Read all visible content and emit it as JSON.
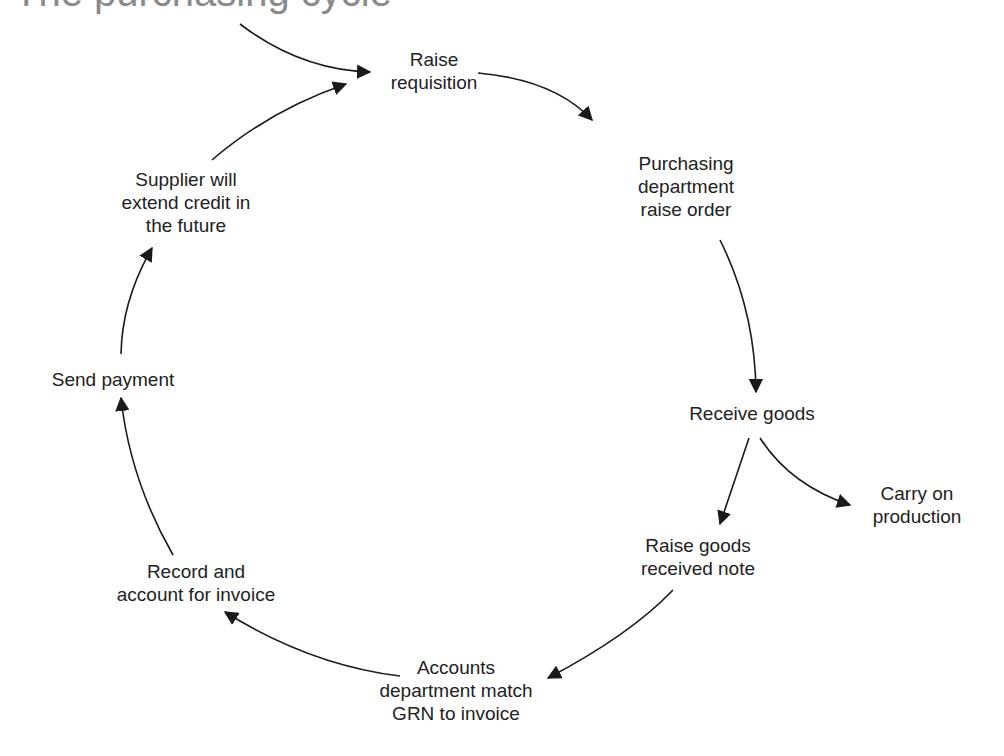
{
  "title": "The purchasing cycle",
  "nodes": {
    "raise_requisition": "Raise\nrequisition",
    "purchasing_raise_order": "Purchasing\ndepartment\nraise order",
    "receive_goods": "Receive goods",
    "carry_on_production": "Carry on\nproduction",
    "raise_grn": "Raise goods\nreceived note",
    "accounts_match": "Accounts\ndepartment match\nGRN to invoice",
    "record_invoice": "Record and\naccount for invoice",
    "send_payment": "Send payment",
    "supplier_credit": "Supplier will\nextend credit in\nthe future"
  },
  "colors": {
    "text": "#222222",
    "arrow": "#1a1a1a",
    "title": "#8a8a8a",
    "background": "#ffffff"
  }
}
